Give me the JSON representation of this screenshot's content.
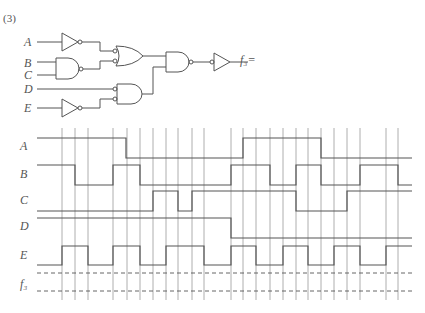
{
  "problem_number": "(3)",
  "circuit": {
    "inputs": [
      "A",
      "B",
      "C",
      "D",
      "E"
    ],
    "output_label": "f₃=",
    "gates": [
      {
        "id": "not_a",
        "type": "NOT",
        "inputs": [
          "A"
        ]
      },
      {
        "id": "nand_bc",
        "type": "NAND",
        "inputs": [
          "B",
          "C"
        ]
      },
      {
        "id": "or1",
        "type": "OR (bubbled inputs)",
        "inputs": [
          "not_a",
          "nand_bc"
        ]
      },
      {
        "id": "not_e",
        "type": "NOT",
        "inputs": [
          "E"
        ]
      },
      {
        "id": "and_de",
        "type": "AND (bubbled inputs)",
        "inputs": [
          "D",
          "not_e"
        ]
      },
      {
        "id": "nand_out",
        "type": "NAND",
        "inputs": [
          "or1",
          "and_de"
        ]
      },
      {
        "id": "buf_out",
        "type": "Buffer (bubbled input)",
        "inputs": [
          "nand_out"
        ]
      }
    ]
  },
  "timing": {
    "x_start": 37,
    "x_end": 412,
    "grid_x": [
      62,
      75,
      88,
      113,
      127,
      140,
      153,
      166,
      178,
      192,
      204,
      231,
      243,
      256,
      270,
      283,
      296,
      308,
      321,
      334,
      347,
      360,
      386,
      398
    ],
    "signals": [
      {
        "name": "A",
        "label_y": 150,
        "high_y": 138,
        "low_y": 158,
        "segments": [
          [
            37,
            126,
            1
          ],
          [
            126,
            243,
            0
          ],
          [
            243,
            321,
            1
          ],
          [
            321,
            412,
            0
          ]
        ]
      },
      {
        "name": "B",
        "label_y": 178,
        "high_y": 165,
        "low_y": 185,
        "segments": [
          [
            37,
            75,
            1
          ],
          [
            75,
            113,
            0
          ],
          [
            113,
            140,
            1
          ],
          [
            140,
            231,
            0
          ],
          [
            231,
            270,
            1
          ],
          [
            270,
            296,
            0
          ],
          [
            296,
            321,
            1
          ],
          [
            321,
            360,
            0
          ],
          [
            360,
            398,
            1
          ],
          [
            398,
            412,
            0
          ]
        ]
      },
      {
        "name": "C",
        "label_y": 204,
        "high_y": 191,
        "low_y": 211,
        "segments": [
          [
            37,
            153,
            0
          ],
          [
            153,
            178,
            1
          ],
          [
            178,
            192,
            0
          ],
          [
            192,
            296,
            1
          ],
          [
            296,
            347,
            0
          ],
          [
            347,
            412,
            1
          ]
        ]
      },
      {
        "name": "D",
        "label_y": 230,
        "high_y": 218,
        "low_y": 238,
        "segments": [
          [
            37,
            231,
            1
          ],
          [
            231,
            412,
            0
          ]
        ]
      },
      {
        "name": "E",
        "label_y": 259,
        "high_y": 246,
        "low_y": 265,
        "segments": [
          [
            37,
            62,
            0
          ],
          [
            62,
            88,
            1
          ],
          [
            88,
            113,
            0
          ],
          [
            113,
            140,
            1
          ],
          [
            140,
            166,
            0
          ],
          [
            166,
            204,
            1
          ],
          [
            204,
            231,
            0
          ],
          [
            231,
            256,
            1
          ],
          [
            256,
            283,
            0
          ],
          [
            283,
            308,
            1
          ],
          [
            308,
            334,
            0
          ],
          [
            334,
            360,
            1
          ],
          [
            360,
            386,
            0
          ],
          [
            386,
            412,
            1
          ]
        ]
      }
    ],
    "output": {
      "name": "f₃",
      "label_y": 288,
      "dashed_y": [
        273,
        291
      ]
    }
  },
  "colors": {
    "line": "#555555",
    "grid": "#9a9a9a",
    "text": "#555555"
  }
}
